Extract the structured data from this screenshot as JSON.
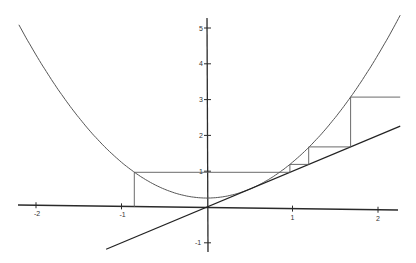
{
  "chart_data": {
    "type": "line",
    "title": "",
    "xlabel": "",
    "ylabel": "",
    "xlim": [
      -2.4,
      2.3
    ],
    "ylim": [
      -1.2,
      5.3
    ],
    "grid": false,
    "legend": null,
    "x_ticks": [
      -2,
      -1,
      1,
      2
    ],
    "x_tick_labels": [
      "-2",
      "-1",
      "1",
      "2"
    ],
    "y_ticks": [
      5,
      4,
      3,
      2,
      1,
      -1
    ],
    "y_tick_labels": [
      "5",
      "4",
      "3",
      "2",
      "1",
      "-1"
    ],
    "series": [
      {
        "name": "f(x) = x^2 + 1/4",
        "kind": "curve",
        "x_range": [
          -2.2,
          2.26
        ]
      },
      {
        "name": "y = x",
        "kind": "line",
        "x_range": [
          -1.18,
          2.26
        ]
      },
      {
        "name": "cobweb orbit",
        "kind": "cobweb",
        "x0": -0.85,
        "points": [
          [
            -0.85,
            0
          ],
          [
            -0.85,
            0.97
          ],
          [
            0.97,
            0.97
          ],
          [
            0.97,
            1.19
          ],
          [
            1.19,
            1.19
          ],
          [
            1.19,
            1.68
          ],
          [
            1.68,
            1.68
          ],
          [
            1.68,
            3.07
          ],
          [
            2.26,
            3.07
          ]
        ]
      }
    ]
  },
  "layout": {
    "origin_px": [
      207,
      207
    ],
    "x_scale_px": 85.5,
    "y_scale_px": 35.8
  }
}
